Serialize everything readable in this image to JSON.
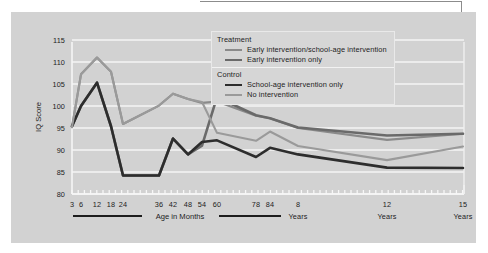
{
  "figure": {
    "background_color": "#d2d2d2",
    "plot_background_color": "#d2d2d2",
    "gridline_color": "#f5f5f5"
  },
  "legend": {
    "groups": [
      {
        "title": "Treatment",
        "entries": [
          {
            "label": "Early intervention/school-age intervention",
            "color": "#8a8a8a",
            "width": 2.1
          },
          {
            "label": "Early intervention only",
            "color": "#6a6a6a",
            "width": 2.6
          }
        ]
      },
      {
        "title": "Control",
        "entries": [
          {
            "label": "School-age intervention only",
            "color": "#2d2d2d",
            "width": 2.6
          },
          {
            "label": "No intervention",
            "color": "#9a9a9a",
            "width": 2.1
          }
        ]
      }
    ]
  },
  "axis_labels": {
    "months_label": "Age in Months",
    "years_label_8": "Years",
    "years_label_12": "Years",
    "years_label_15": "Years"
  },
  "chart_data": {
    "type": "line",
    "title": "",
    "xlabel": "Age in Months",
    "ylabel": "IQ Score",
    "ylim": [
      80,
      115
    ],
    "yticks": [
      80,
      85,
      90,
      95,
      100,
      105,
      110,
      115
    ],
    "ytick_labels": [
      "80",
      "85",
      "90",
      "95",
      "100",
      "105",
      "110",
      "115"
    ],
    "grid": true,
    "legend_position": "top-right",
    "x_months_ticks": [
      3,
      6,
      12,
      18,
      24,
      36,
      42,
      48,
      54,
      60,
      78,
      84
    ],
    "x_months_tick_labels": [
      "3",
      "6",
      "12",
      "18",
      "24",
      "36",
      "42",
      "48",
      "54",
      "60",
      "78",
      "84"
    ],
    "x_years_ticks": [
      8,
      12,
      15
    ],
    "x_years_tick_labels": [
      "8",
      "12",
      "15"
    ],
    "x": [
      3,
      6,
      12,
      18,
      24,
      36,
      42,
      48,
      54,
      60,
      78,
      84,
      96,
      144,
      180
    ],
    "x_display": [
      "3",
      "6",
      "12",
      "18",
      "24",
      "36",
      "42",
      "48",
      "54",
      "60",
      "78",
      "84",
      "8 Years",
      "12 Years",
      "15 Years"
    ],
    "series": [
      {
        "name": "Early intervention/school-age intervention",
        "group": "Treatment",
        "color": "#8a8a8a",
        "width": 2.1,
        "values": [
          95.2,
          107.2,
          111.0,
          107.8,
          95.9,
          100.1,
          102.8,
          101.6,
          100.7,
          101.0,
          97.8,
          97.2,
          95.0,
          92.3,
          93.7
        ]
      },
      {
        "name": "Early intervention only",
        "group": "Treatment",
        "color": "#6a6a6a",
        "width": 2.6,
        "values": [
          95.4,
          100.0,
          105.3,
          95.4,
          84.2,
          84.2,
          92.6,
          89.0,
          91.0,
          102.0,
          97.9,
          97.2,
          95.1,
          93.3,
          93.7
        ]
      },
      {
        "name": "School-age intervention only",
        "group": "Control",
        "color": "#2d2d2d",
        "width": 2.6,
        "values": [
          95.4,
          100.0,
          105.3,
          95.4,
          84.2,
          84.2,
          92.6,
          89.0,
          91.8,
          92.2,
          88.4,
          90.5,
          89.0,
          86.0,
          85.9
        ]
      },
      {
        "name": "No intervention",
        "group": "Control",
        "color": "#9a9a9a",
        "width": 2.1,
        "values": [
          95.2,
          107.2,
          111.0,
          107.8,
          95.9,
          100.1,
          102.8,
          101.6,
          100.9,
          93.9,
          92.1,
          94.2,
          90.9,
          87.7,
          90.8
        ]
      }
    ]
  }
}
